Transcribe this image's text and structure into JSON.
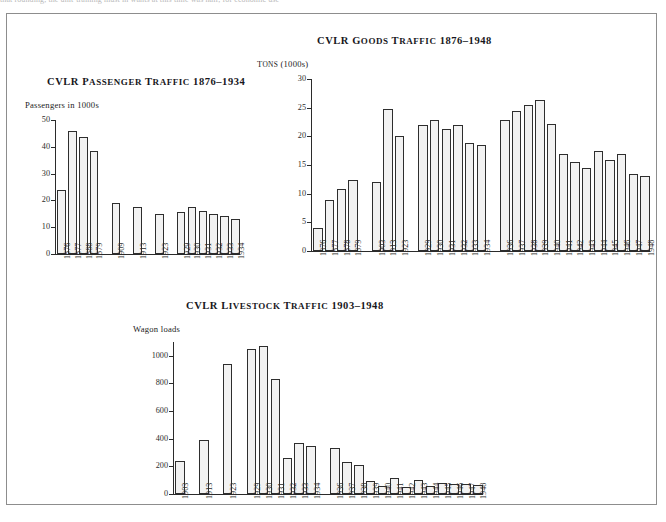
{
  "page": {
    "top_clipped_text": "that rounding, the unit-training must in           wants at this time was half, for economic use"
  },
  "figures": [
    {
      "id": "passenger",
      "title": "CVLR Passenger Traffic 1876–1934",
      "title_words": [
        "CVLR",
        "Passenger",
        "Traffic",
        "1876–1934"
      ],
      "y_axis_label": "Passengers in 1000s"
    },
    {
      "id": "goods",
      "title": "CVLR Goods Traffic 1876–1948",
      "title_words": [
        "CVLR",
        "Goods",
        "Traffic",
        "1876–1948"
      ],
      "y_axis_label": "Tons (1000s)"
    },
    {
      "id": "livestock",
      "title": "CVLR Livestock Traffic 1903–1948",
      "title_words": [
        "CVLR",
        "Livestock",
        "Traffic",
        "1903–1948"
      ],
      "y_axis_label": "Wagon loads"
    }
  ],
  "chart_data": [
    {
      "type": "bar",
      "id": "passenger",
      "title": "CVLR Passenger Traffic 1876–1934",
      "xlabel": "",
      "ylabel": "Passengers in 1000s",
      "ylim": [
        0,
        50
      ],
      "yticks": [
        0,
        10,
        20,
        30,
        40,
        50
      ],
      "ytick_labels": [
        "0",
        "10",
        "20",
        "30",
        "40",
        "50"
      ],
      "grid": false,
      "legend": "none",
      "categories": [
        "1876",
        "1877",
        "1888",
        "1879",
        "1909",
        "1913",
        "1923",
        "1929",
        "1930",
        "1931",
        "1932",
        "1933",
        "1934"
      ],
      "values": [
        24.0,
        46.0,
        43.5,
        38.5,
        19.0,
        17.5,
        14.8,
        15.8,
        17.5,
        16.0,
        15.0,
        14.0,
        13.2
      ],
      "gaps_after": [
        "1879",
        "1909",
        "1913",
        "1923"
      ]
    },
    {
      "type": "bar",
      "id": "goods",
      "title": "CVLR Goods Traffic 1876–1948",
      "xlabel": "",
      "ylabel": "Tons (1000s)",
      "ylim": [
        0,
        30
      ],
      "yticks": [
        0,
        5,
        10,
        15,
        20,
        25,
        30
      ],
      "ytick_labels": [
        "0",
        "5",
        "10",
        "15",
        "20",
        "25",
        "30"
      ],
      "grid": false,
      "legend": "none",
      "categories": [
        "1876",
        "1877",
        "1878",
        "1879",
        "1903",
        "1913",
        "1923",
        "1929",
        "1930",
        "1931",
        "1932",
        "1933",
        "1934",
        "1936",
        "1937",
        "1938",
        "1939",
        "1940",
        "1941",
        "1942",
        "1943",
        "1944",
        "1945",
        "1946",
        "1947",
        "1948"
      ],
      "values": [
        4.1,
        8.9,
        10.8,
        12.4,
        12.0,
        24.8,
        20.0,
        22.0,
        22.8,
        21.3,
        22.0,
        18.9,
        18.5,
        22.9,
        24.4,
        25.5,
        26.3,
        22.1,
        17.0,
        15.6,
        14.4,
        17.4,
        15.8,
        16.9,
        13.5,
        13.1,
        12.6
      ],
      "gaps_after": [
        "1879",
        "1923",
        "1934"
      ]
    },
    {
      "type": "bar",
      "id": "livestock",
      "title": "CVLR Livestock Traffic 1903–1948",
      "xlabel": "",
      "ylabel": "Wagon loads",
      "ylim": [
        0,
        1100
      ],
      "yticks": [
        0,
        200,
        400,
        600,
        800,
        1000
      ],
      "ytick_labels": [
        "0",
        "200",
        "400",
        "600",
        "800",
        "1000"
      ],
      "grid": false,
      "legend": "none",
      "categories": [
        "1903",
        "1913",
        "1923",
        "1929",
        "1930",
        "1931",
        "1932",
        "1933",
        "1934",
        "1936",
        "1937",
        "1938",
        "1939",
        "1940",
        "1941",
        "1942",
        "1943",
        "1944",
        "1945",
        "1946",
        "1947",
        "1948"
      ],
      "values": [
        238,
        392,
        940,
        1050,
        1068,
        832,
        263,
        372,
        350,
        335,
        231,
        211,
        95,
        55,
        118,
        52,
        103,
        55,
        83,
        74,
        72,
        62
      ],
      "gaps_after": [
        "1903",
        "1913",
        "1923",
        "1934"
      ]
    }
  ]
}
